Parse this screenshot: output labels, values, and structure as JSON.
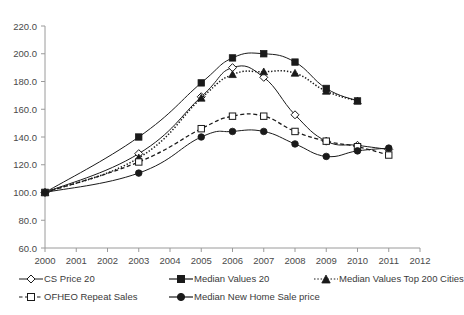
{
  "chart_data": {
    "type": "line",
    "title": "",
    "xlabel": "",
    "ylabel": "",
    "x": [
      2000,
      2001,
      2002,
      2003,
      2004,
      2005,
      2006,
      2007,
      2008,
      2009,
      2010,
      2011
    ],
    "xlim": [
      2000,
      2012
    ],
    "ylim": [
      60.0,
      220.0
    ],
    "ytick_step": 20.0,
    "grid": false,
    "legend_position": "bottom",
    "xtick_labels": [
      "2000",
      "2001",
      "2002",
      "2003",
      "2004",
      "2005",
      "2006",
      "2007",
      "2008",
      "2009",
      "2010",
      "2011",
      "2012"
    ],
    "ytick_labels": [
      "60.0",
      "80.0",
      "100.0",
      "120.0",
      "140.0",
      "160.0",
      "180.0",
      "200.0",
      "220.0"
    ],
    "series": [
      {
        "name": "CS Price 20",
        "marker": "open-diamond",
        "line_style": "solid",
        "points": [
          {
            "x": 2000,
            "y": 100
          },
          {
            "x": 2003,
            "y": 128
          },
          {
            "x": 2005,
            "y": 169
          },
          {
            "x": 2006,
            "y": 190
          },
          {
            "x": 2007,
            "y": 183
          },
          {
            "x": 2008,
            "y": 156
          },
          {
            "x": 2009,
            "y": 137
          },
          {
            "x": 2010,
            "y": 134
          },
          {
            "x": 2011,
            "y": 131
          }
        ]
      },
      {
        "name": "Median Values 20",
        "marker": "filled-square",
        "line_style": "solid",
        "points": [
          {
            "x": 2000,
            "y": 100
          },
          {
            "x": 2003,
            "y": 140
          },
          {
            "x": 2005,
            "y": 179
          },
          {
            "x": 2006,
            "y": 197
          },
          {
            "x": 2007,
            "y": 200
          },
          {
            "x": 2008,
            "y": 194
          },
          {
            "x": 2009,
            "y": 175
          },
          {
            "x": 2010,
            "y": 166
          }
        ]
      },
      {
        "name": "Median Values Top 200 Cities",
        "marker": "filled-triangle",
        "line_style": "dotted",
        "points": [
          {
            "x": 2000,
            "y": 100
          },
          {
            "x": 2003,
            "y": 125
          },
          {
            "x": 2005,
            "y": 168
          },
          {
            "x": 2006,
            "y": 185
          },
          {
            "x": 2007,
            "y": 187
          },
          {
            "x": 2008,
            "y": 186
          },
          {
            "x": 2009,
            "y": 173
          },
          {
            "x": 2010,
            "y": 166
          }
        ]
      },
      {
        "name": "OFHEO Repeat Sales",
        "marker": "open-square",
        "line_style": "dashed",
        "points": [
          {
            "x": 2000,
            "y": 100
          },
          {
            "x": 2003,
            "y": 122
          },
          {
            "x": 2005,
            "y": 146
          },
          {
            "x": 2006,
            "y": 155
          },
          {
            "x": 2007,
            "y": 155
          },
          {
            "x": 2008,
            "y": 144
          },
          {
            "x": 2009,
            "y": 137
          },
          {
            "x": 2010,
            "y": 133
          },
          {
            "x": 2011,
            "y": 127
          }
        ]
      },
      {
        "name": "Median New Home Sale price",
        "marker": "filled-circle",
        "line_style": "solid",
        "points": [
          {
            "x": 2000,
            "y": 100
          },
          {
            "x": 2003,
            "y": 114
          },
          {
            "x": 2005,
            "y": 140
          },
          {
            "x": 2006,
            "y": 144
          },
          {
            "x": 2007,
            "y": 144
          },
          {
            "x": 2008,
            "y": 135
          },
          {
            "x": 2009,
            "y": 126
          },
          {
            "x": 2010,
            "y": 130
          },
          {
            "x": 2011,
            "y": 132
          }
        ]
      }
    ]
  },
  "legend": {
    "items": [
      {
        "label": "CS Price 20"
      },
      {
        "label": "Median Values 20"
      },
      {
        "label": "Median Values Top 200 Cities"
      },
      {
        "label": "OFHEO Repeat Sales"
      },
      {
        "label": "Median New Home Sale price"
      }
    ]
  },
  "colors": {
    "series": "#1a1a1a",
    "axis": "#9a9a9a",
    "text": "#3a3a3a"
  }
}
